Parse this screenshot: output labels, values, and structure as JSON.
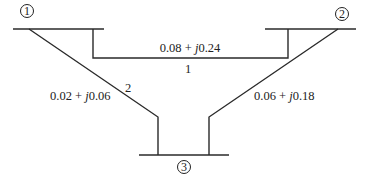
{
  "diagram": {
    "title": "",
    "buses": [
      {
        "id": "1",
        "label": "1"
      },
      {
        "id": "2",
        "label": "2"
      },
      {
        "id": "3",
        "label": "3"
      }
    ],
    "lines": [
      {
        "number": "1",
        "from": "1",
        "to": "2",
        "impedance_real": "0.08",
        "impedance_imag": "0.24",
        "impedance_text_a": "0.08 + ",
        "impedance_j": "j",
        "impedance_text_b": "0.24"
      },
      {
        "number": "2",
        "from": "1",
        "to": "3",
        "impedance_real": "0.02",
        "impedance_imag": "0.06",
        "impedance_text_a": "0.02 + ",
        "impedance_j": "j",
        "impedance_text_b": "0.06"
      },
      {
        "number": "",
        "from": "2",
        "to": "3",
        "impedance_real": "0.06",
        "impedance_imag": "0.18",
        "impedance_text_a": "0.06 + ",
        "impedance_j": "j",
        "impedance_text_b": "0.18"
      }
    ],
    "line_color": "#2a2a2a"
  }
}
